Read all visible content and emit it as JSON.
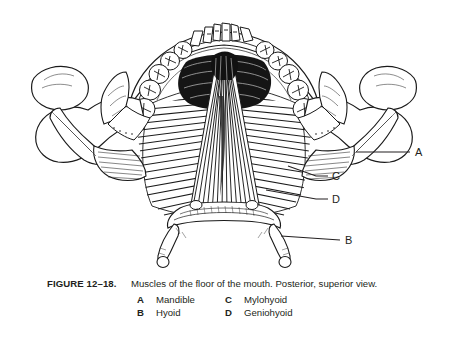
{
  "figure": {
    "number": "FIGURE 12–18.",
    "caption": "Muscles of the floor of the mouth. Posterior, superior view.",
    "legend": [
      {
        "key": "A",
        "value": "Mandible"
      },
      {
        "key": "B",
        "value": "Hyoid"
      },
      {
        "key": "C",
        "value": "Mylohyoid"
      },
      {
        "key": "D",
        "value": "Geniohyoid"
      }
    ],
    "callouts": [
      {
        "key": "A",
        "x": 417,
        "y": 156
      },
      {
        "key": "C",
        "x": 334,
        "y": 179
      },
      {
        "key": "D",
        "x": 334,
        "y": 202
      },
      {
        "key": "B",
        "x": 348,
        "y": 243
      }
    ],
    "colors": {
      "ink": "#231f20",
      "background": "#ffffff",
      "line": "#1a1a1a"
    }
  }
}
